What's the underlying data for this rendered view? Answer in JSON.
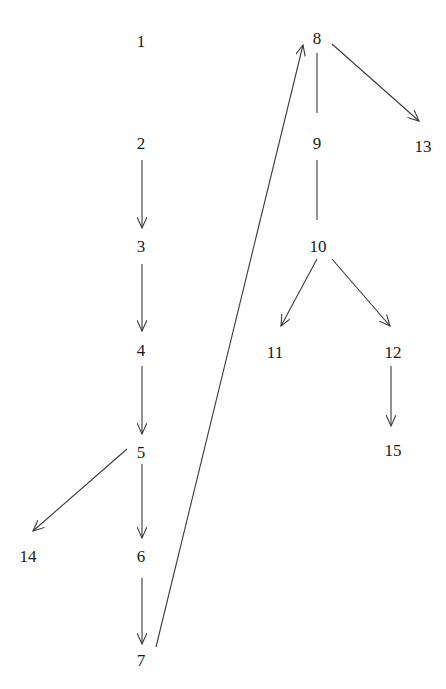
{
  "diagram": {
    "type": "directed-graph",
    "colors": {
      "edge": "#3a3a3a",
      "text": "#1a1a1a",
      "background": "#ffffff"
    },
    "nodes": [
      {
        "id": "1",
        "label": "1",
        "x": 141,
        "y": 41
      },
      {
        "id": "2",
        "label": "2",
        "x": 141,
        "y": 143
      },
      {
        "id": "3",
        "label": "3",
        "x": 141,
        "y": 246
      },
      {
        "id": "4",
        "label": "4",
        "x": 141,
        "y": 350
      },
      {
        "id": "5",
        "label": "5",
        "x": 141,
        "y": 452
      },
      {
        "id": "6",
        "label": "6",
        "x": 141,
        "y": 556
      },
      {
        "id": "7",
        "label": "7",
        "x": 141,
        "y": 660
      },
      {
        "id": "8",
        "label": "8",
        "x": 317,
        "y": 38
      },
      {
        "id": "9",
        "label": "9",
        "x": 317,
        "y": 143
      },
      {
        "id": "10",
        "label": "10",
        "x": 318,
        "y": 246
      },
      {
        "id": "11",
        "label": "11",
        "x": 275,
        "y": 352
      },
      {
        "id": "12",
        "label": "12",
        "x": 393,
        "y": 352
      },
      {
        "id": "13",
        "label": "13",
        "x": 423,
        "y": 146
      },
      {
        "id": "14",
        "label": "14",
        "x": 28,
        "y": 556
      },
      {
        "id": "15",
        "label": "15",
        "x": 393,
        "y": 450
      }
    ],
    "edges": [
      {
        "from": "2",
        "to": "3",
        "directed": true,
        "x1": 142,
        "y1": 160,
        "x2": 142,
        "y2": 228
      },
      {
        "from": "3",
        "to": "4",
        "directed": true,
        "x1": 142,
        "y1": 264,
        "x2": 142,
        "y2": 331
      },
      {
        "from": "4",
        "to": "5",
        "directed": true,
        "x1": 142,
        "y1": 366,
        "x2": 142,
        "y2": 434
      },
      {
        "from": "5",
        "to": "6",
        "directed": true,
        "x1": 142,
        "y1": 464,
        "x2": 142,
        "y2": 538
      },
      {
        "from": "6",
        "to": "7",
        "directed": true,
        "x1": 142,
        "y1": 578,
        "x2": 142,
        "y2": 644
      },
      {
        "from": "5",
        "to": "14",
        "directed": true,
        "x1": 127,
        "y1": 449,
        "x2": 33,
        "y2": 531
      },
      {
        "from": "7",
        "to": "8",
        "directed": true,
        "x1": 156,
        "y1": 647,
        "x2": 303,
        "y2": 45
      },
      {
        "from": "8",
        "to": "9",
        "directed": false,
        "x1": 317,
        "y1": 53,
        "x2": 317,
        "y2": 113
      },
      {
        "from": "9",
        "to": "10",
        "directed": false,
        "x1": 317,
        "y1": 160,
        "x2": 317,
        "y2": 220
      },
      {
        "from": "8",
        "to": "13",
        "directed": true,
        "x1": 332,
        "y1": 44,
        "x2": 419,
        "y2": 121
      },
      {
        "from": "10",
        "to": "11",
        "directed": true,
        "x1": 317,
        "y1": 259,
        "x2": 281,
        "y2": 326
      },
      {
        "from": "10",
        "to": "12",
        "directed": true,
        "x1": 332,
        "y1": 259,
        "x2": 390,
        "y2": 326
      },
      {
        "from": "12",
        "to": "15",
        "directed": true,
        "x1": 391,
        "y1": 366,
        "x2": 391,
        "y2": 426
      }
    ]
  }
}
